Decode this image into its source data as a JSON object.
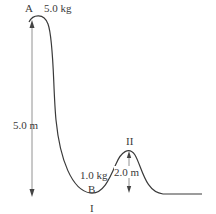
{
  "diagram": {
    "labels": {
      "point_a": "A",
      "mass_a": "5.0 kg",
      "height_a": "5.0 m",
      "mass_b": "1.0 kg",
      "point_b": "B",
      "point_1": "I",
      "point_2": "II",
      "height_2": "2.0 m"
    },
    "colors": {
      "track": "#3a3a3a",
      "arrow": "#555555",
      "background": "#ffffff"
    }
  }
}
